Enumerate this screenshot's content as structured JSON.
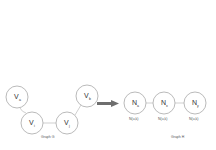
{
  "diagram": {
    "left_graph": {
      "caption": "Graph G",
      "nodes": [
        {
          "id": "Va",
          "label": "V",
          "sub": "a",
          "x": 17,
          "y": 97
        },
        {
          "id": "Vi",
          "label": "V",
          "sub": "i",
          "x": 32,
          "y": 123
        },
        {
          "id": "Vj",
          "label": "V",
          "sub": "j",
          "x": 67,
          "y": 123
        },
        {
          "id": "Vb",
          "label": "V",
          "sub": "b",
          "x": 87,
          "y": 96
        }
      ],
      "edges": [
        [
          "Va",
          "Vi"
        ],
        [
          "Vi",
          "Vj"
        ],
        [
          "Vj",
          "Vb"
        ]
      ]
    },
    "arrow": {
      "color": "#6e6e6e",
      "direction": "right"
    },
    "right_graph": {
      "caption": "Graph H",
      "nodes": [
        {
          "id": "N1",
          "label": "N",
          "sub": "a",
          "x": 135,
          "y": 103,
          "annotation": "N(u,k)"
        },
        {
          "id": "N2",
          "label": "N",
          "sub": "x",
          "x": 164,
          "y": 103,
          "annotation": "N(u,k)"
        },
        {
          "id": "N3",
          "label": "N",
          "sub": "y",
          "x": 195,
          "y": 103,
          "annotation": "N(u,k)"
        }
      ],
      "edges": [
        [
          "N1",
          "N2"
        ],
        [
          "N2",
          "N3"
        ]
      ]
    }
  }
}
